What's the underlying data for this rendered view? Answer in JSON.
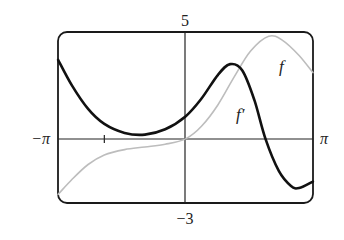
{
  "chart_data": {
    "type": "line",
    "title": "",
    "xlabel": "",
    "ylabel": "",
    "xlim": [
      -3.14159,
      3.14159
    ],
    "ylim": [
      -3,
      5
    ],
    "grid": false,
    "legend": "inline labels",
    "tick_labels": {
      "x_left": "−π",
      "x_right": "π",
      "y_top": "5",
      "y_bottom": "−3"
    },
    "x_ticks": [
      -2
    ],
    "series": [
      {
        "name": "f",
        "label": "f",
        "color": "#bdbdbd",
        "style": "thin gray",
        "points": [
          [
            -3.14,
            -2.6
          ],
          [
            -2.8,
            -1.9
          ],
          [
            -2.4,
            -1.2
          ],
          [
            -2.0,
            -0.75
          ],
          [
            -1.5,
            -0.5
          ],
          [
            -1.0,
            -0.38
          ],
          [
            -0.5,
            -0.25
          ],
          [
            0.0,
            0.0
          ],
          [
            0.4,
            0.6
          ],
          [
            0.8,
            1.6
          ],
          [
            1.2,
            2.9
          ],
          [
            1.6,
            4.1
          ],
          [
            2.05,
            4.8
          ],
          [
            2.4,
            4.6
          ],
          [
            2.8,
            3.9
          ],
          [
            3.14,
            3.1
          ]
        ]
      },
      {
        "name": "f'",
        "label": "f′",
        "color": "#111111",
        "style": "thick black",
        "points": [
          [
            -3.14,
            3.7
          ],
          [
            -2.8,
            2.5
          ],
          [
            -2.4,
            1.4
          ],
          [
            -2.0,
            0.7
          ],
          [
            -1.5,
            0.28
          ],
          [
            -1.0,
            0.2
          ],
          [
            -0.5,
            0.45
          ],
          [
            0.0,
            1.05
          ],
          [
            0.4,
            1.9
          ],
          [
            0.8,
            3.0
          ],
          [
            1.1,
            3.5
          ],
          [
            1.4,
            3.2
          ],
          [
            1.7,
            1.8
          ],
          [
            1.97,
            0.0
          ],
          [
            2.3,
            -1.5
          ],
          [
            2.6,
            -2.2
          ],
          [
            2.8,
            -2.3
          ],
          [
            3.14,
            -2.0
          ]
        ]
      }
    ],
    "annotations": [
      {
        "text": "f",
        "near": "f curve, right side",
        "x": 2.35,
        "y": 3.6
      },
      {
        "text": "f′",
        "near": "f' curve, descending",
        "x": 1.3,
        "y": 1.5
      }
    ]
  },
  "labels": {
    "y_top": "5",
    "y_bottom": "−3",
    "x_left": "−π",
    "x_right": "π",
    "f_label": "f",
    "fprime_label": "f′"
  }
}
